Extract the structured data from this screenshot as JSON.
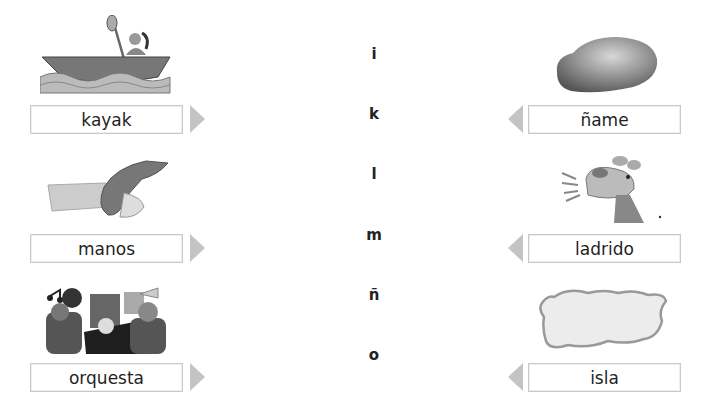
{
  "left_column": [
    {
      "word": "kayak",
      "image": "kayak-illustration"
    },
    {
      "word": "manos",
      "image": "hands-illustration"
    },
    {
      "word": "orquesta",
      "image": "orchestra-illustration"
    }
  ],
  "right_column": [
    {
      "word": "ñame",
      "image": "yam-illustration"
    },
    {
      "word": "ladrido",
      "image": "barking-dog-illustration"
    },
    {
      "word": "isla",
      "image": "island-illustration"
    }
  ],
  "letters": [
    "i",
    "k",
    "l",
    "m",
    "ñ",
    "o"
  ],
  "colors": {
    "box_border": "#c9c9c9",
    "arrow": "#c4c4c4",
    "text": "#1f1f1f"
  }
}
